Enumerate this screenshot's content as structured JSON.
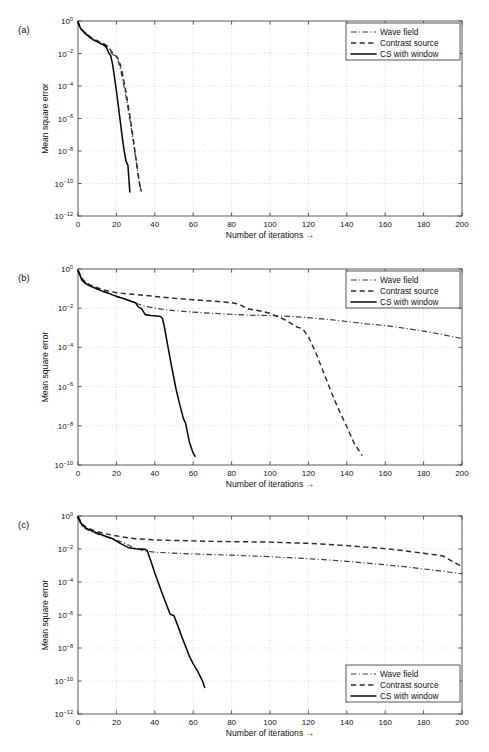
{
  "figure": {
    "panels": [
      {
        "id": "a",
        "label": "(a)",
        "legend_position": "top-right",
        "chart_data": {
          "type": "line",
          "title": "",
          "xlabel": "Number of iterations →",
          "ylabel": "Mean square error",
          "xlim": [
            0,
            200
          ],
          "ylim": [
            1e-12,
            1
          ],
          "yscale": "log",
          "grid": true,
          "xticks": [
            0,
            20,
            40,
            60,
            80,
            100,
            120,
            140,
            160,
            180,
            200
          ],
          "xticklabels": [
            "0",
            "20",
            "40",
            "60",
            "80",
            "100",
            "120",
            "140",
            "160",
            "180",
            "200"
          ],
          "yticks": [
            1,
            0.01,
            0.0001,
            1e-06,
            1e-08,
            1e-10,
            1e-12
          ],
          "yticklabels": [
            "10 0",
            "10 -2",
            "10 -4",
            "10 -6",
            "10 -8",
            "10 -10",
            "10 -12"
          ],
          "series": [
            {
              "name": "Wave field",
              "style": "dashdot",
              "x": [
                0,
                1,
                2,
                3,
                4,
                5,
                6,
                7,
                8,
                9,
                10,
                11,
                12,
                13,
                14,
                15,
                16,
                17,
                18,
                19,
                20,
                21,
                22,
                23,
                24,
                25,
                26,
                27,
                28,
                29,
                30,
                31,
                32,
                33
              ],
              "y": [
                0.85,
                0.4,
                0.26,
                0.2,
                0.16,
                0.13,
                0.1,
                0.085,
                0.07,
                0.062,
                0.055,
                0.048,
                0.042,
                0.038,
                0.033,
                0.028,
                0.022,
                0.012,
                0.009,
                0.0075,
                0.006,
                0.0035,
                0.0012,
                0.00035,
                9e-05,
                2.2e-05,
                4.5e-06,
                9e-07,
                1.6e-07,
                2.6e-08,
                4e-09,
                6e-10,
                9e-11,
                3.2e-11
              ]
            },
            {
              "name": "Contrast source",
              "style": "dashed",
              "x": [
                0,
                1,
                2,
                3,
                4,
                5,
                6,
                7,
                8,
                9,
                10,
                11,
                12,
                13,
                14,
                15,
                16,
                17,
                18,
                19,
                20,
                21,
                22,
                23,
                24,
                25,
                26,
                27,
                28,
                29,
                30,
                31,
                32,
                33
              ],
              "y": [
                0.9,
                0.45,
                0.3,
                0.23,
                0.18,
                0.145,
                0.115,
                0.095,
                0.08,
                0.07,
                0.062,
                0.054,
                0.047,
                0.042,
                0.036,
                0.03,
                0.024,
                0.016,
                0.011,
                0.0085,
                0.0065,
                0.0045,
                0.0021,
                0.0007,
                0.00018,
                4e-05,
                8e-06,
                1.5e-06,
                2.4e-07,
                3.6e-08,
                5e-09,
                7e-10,
                1.1e-10,
                3.2e-11
              ]
            },
            {
              "name": "CS with window",
              "style": "solid",
              "x": [
                0,
                1,
                2,
                3,
                4,
                5,
                6,
                7,
                8,
                9,
                10,
                11,
                12,
                13,
                14,
                15,
                16,
                17,
                18,
                19,
                20,
                21,
                22,
                23,
                24,
                25,
                26,
                27
              ],
              "y": [
                0.88,
                0.42,
                0.27,
                0.21,
                0.165,
                0.13,
                0.1,
                0.084,
                0.069,
                0.06,
                0.052,
                0.045,
                0.04,
                0.035,
                0.03,
                0.021,
                0.011,
                0.0075,
                0.0022,
                0.00035,
                5e-05,
                6e-06,
                7e-07,
                8e-08,
                1.1e-08,
                2.4e-09,
                1.3e-09,
                3e-11
              ]
            }
          ]
        }
      },
      {
        "id": "b",
        "label": "(b)",
        "legend_position": "top-right",
        "chart_data": {
          "type": "line",
          "title": "",
          "xlabel": "Number of iterations →",
          "ylabel": "Mean square error",
          "xlim": [
            0,
            200
          ],
          "ylim": [
            1e-10,
            1
          ],
          "yscale": "log",
          "grid": true,
          "xticks": [
            0,
            20,
            40,
            60,
            80,
            100,
            120,
            140,
            160,
            180,
            200
          ],
          "xticklabels": [
            "0",
            "20",
            "40",
            "60",
            "80",
            "100",
            "120",
            "140",
            "160",
            "180",
            "200"
          ],
          "yticks": [
            1,
            0.01,
            0.0001,
            1e-06,
            1e-08,
            1e-10
          ],
          "yticklabels": [
            "10 0",
            "10 -2",
            "10 -4",
            "10 -6",
            "10 -8",
            "10 -10"
          ],
          "series": [
            {
              "name": "Wave field",
              "style": "dashdot",
              "x": [
                0,
                2,
                4,
                6,
                8,
                10,
                13,
                16,
                20,
                25,
                30,
                35,
                40,
                45,
                50,
                60,
                70,
                80,
                90,
                100,
                110,
                120,
                130,
                140,
                150,
                160,
                170,
                180,
                190,
                200
              ],
              "y": [
                0.82,
                0.3,
                0.19,
                0.145,
                0.115,
                0.095,
                0.072,
                0.058,
                0.042,
                0.028,
                0.018,
                0.0125,
                0.01,
                0.0085,
                0.0075,
                0.0063,
                0.0055,
                0.0049,
                0.0044,
                0.0042,
                0.0038,
                0.0033,
                0.0027,
                0.0021,
                0.0016,
                0.0013,
                0.00095,
                0.00068,
                0.00045,
                0.00028
              ]
            },
            {
              "name": "Contrast source",
              "style": "dashed",
              "x": [
                0,
                2,
                4,
                6,
                8,
                10,
                13,
                16,
                20,
                25,
                30,
                35,
                40,
                50,
                60,
                70,
                80,
                84,
                88,
                95,
                100,
                108,
                114,
                117,
                120,
                124,
                128,
                132,
                136,
                140,
                144,
                148
              ],
              "y": [
                0.88,
                0.33,
                0.21,
                0.16,
                0.13,
                0.11,
                0.086,
                0.073,
                0.062,
                0.055,
                0.05,
                0.045,
                0.04,
                0.032,
                0.027,
                0.023,
                0.019,
                0.016,
                0.0095,
                0.0072,
                0.0055,
                0.0025,
                0.0011,
                0.0009,
                0.00035,
                5e-05,
                5e-06,
                5e-07,
                6e-08,
                9e-09,
                1.2e-09,
                3e-10
              ]
            },
            {
              "name": "CS with window",
              "style": "solid",
              "x": [
                0,
                2,
                4,
                6,
                8,
                10,
                13,
                16,
                20,
                24,
                28,
                30,
                31,
                32,
                33,
                35,
                38,
                41,
                43,
                44,
                45,
                47,
                49,
                51,
                53,
                55,
                56,
                58,
                60,
                61
              ],
              "y": [
                0.85,
                0.28,
                0.18,
                0.14,
                0.115,
                0.095,
                0.072,
                0.057,
                0.04,
                0.03,
                0.022,
                0.019,
                0.013,
                0.0105,
                0.01,
                0.0047,
                0.0042,
                0.004,
                0.0038,
                0.003,
                0.0011,
                9e-05,
                8e-06,
                8e-07,
                1.2e-07,
                2.2e-08,
                1.4e-08,
                1.5e-09,
                4e-10,
                2.8e-10
              ]
            }
          ]
        }
      },
      {
        "id": "c",
        "label": "(c)",
        "legend_position": "bottom-right",
        "chart_data": {
          "type": "line",
          "title": "",
          "xlabel": "Number of iterations →",
          "ylabel": "Mean square error",
          "xlim": [
            0,
            200
          ],
          "ylim": [
            1e-12,
            1
          ],
          "yscale": "log",
          "grid": true,
          "xticks": [
            0,
            20,
            40,
            60,
            80,
            100,
            120,
            140,
            160,
            180,
            200
          ],
          "xticklabels": [
            "0",
            "20",
            "40",
            "60",
            "80",
            "100",
            "120",
            "140",
            "160",
            "180",
            "200"
          ],
          "yticks": [
            1,
            0.01,
            0.0001,
            1e-06,
            1e-08,
            1e-10,
            1e-12
          ],
          "yticklabels": [
            "10 0",
            "10 -2",
            "10 -4",
            "10 -6",
            "10 -8",
            "10 -10",
            "10 -12"
          ],
          "series": [
            {
              "name": "Wave field",
              "style": "dashdot",
              "x": [
                0,
                2,
                4,
                6,
                8,
                10,
                14,
                18,
                22,
                26,
                30,
                36,
                42,
                50,
                60,
                70,
                80,
                90,
                100,
                110,
                120,
                130,
                140,
                150,
                160,
                170,
                180,
                190,
                200
              ],
              "y": [
                0.7,
                0.26,
                0.165,
                0.125,
                0.1,
                0.082,
                0.058,
                0.042,
                0.028,
                0.018,
                0.0105,
                0.0072,
                0.0062,
                0.0056,
                0.005,
                0.0046,
                0.0042,
                0.0038,
                0.0034,
                0.003,
                0.0026,
                0.0022,
                0.0018,
                0.0014,
                0.0011,
                0.00085,
                0.00062,
                0.00045,
                0.00032
              ]
            },
            {
              "name": "Contrast source",
              "style": "dashed",
              "x": [
                0,
                2,
                4,
                6,
                8,
                10,
                14,
                18,
                22,
                26,
                30,
                36,
                42,
                50,
                60,
                70,
                80,
                90,
                100,
                110,
                120,
                130,
                140,
                150,
                160,
                170,
                180,
                190,
                200
              ],
              "y": [
                0.92,
                0.34,
                0.22,
                0.17,
                0.14,
                0.115,
                0.085,
                0.068,
                0.057,
                0.048,
                0.042,
                0.038,
                0.035,
                0.033,
                0.031,
                0.029,
                0.028,
                0.027,
                0.026,
                0.024,
                0.022,
                0.019,
                0.016,
                0.013,
                0.0105,
                0.0078,
                0.0055,
                0.0038,
                0.00085
              ]
            },
            {
              "name": "CS with window",
              "style": "solid",
              "x": [
                0,
                2,
                4,
                6,
                8,
                10,
                14,
                18,
                22,
                26,
                28,
                30,
                33,
                35,
                36,
                38,
                40,
                42,
                44,
                46,
                48,
                50,
                52,
                54,
                56,
                58,
                60,
                62,
                64,
                65,
                66
              ],
              "y": [
                0.88,
                0.3,
                0.19,
                0.145,
                0.115,
                0.093,
                0.062,
                0.042,
                0.022,
                0.0125,
                0.011,
                0.0105,
                0.01,
                0.0095,
                0.008,
                0.0018,
                0.00035,
                8e-05,
                1.8e-05,
                4.5e-06,
                1.1e-06,
                9e-07,
                2.2e-07,
                5e-08,
                1.3e-08,
                3.2e-09,
                1.1e-09,
                4.5e-10,
                1.6e-10,
                9e-11,
                4e-11
              ]
            }
          ]
        }
      }
    ]
  }
}
